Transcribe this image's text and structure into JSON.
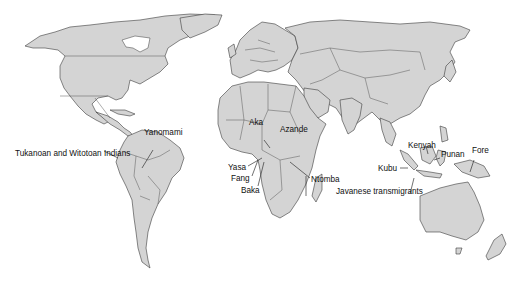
{
  "map": {
    "type": "world political outline map",
    "land_color": "#d4d4d4",
    "border_color": "#3a3a3a",
    "background": "#ffffff"
  },
  "labels": {
    "tukanoan": "Tukanoan and Witotoan Indians",
    "yanomami": "Yanomami",
    "aka": "Aka",
    "azande": "Azande",
    "yasa": "Yasa",
    "fang": "Fang",
    "baka": "Baka",
    "ntomba": "Ntomba",
    "javanese": "Javanese transmigrants",
    "kubu": "Kubu",
    "kenyah": "Kenyah",
    "punan": "Punan",
    "fore": "Fore"
  }
}
